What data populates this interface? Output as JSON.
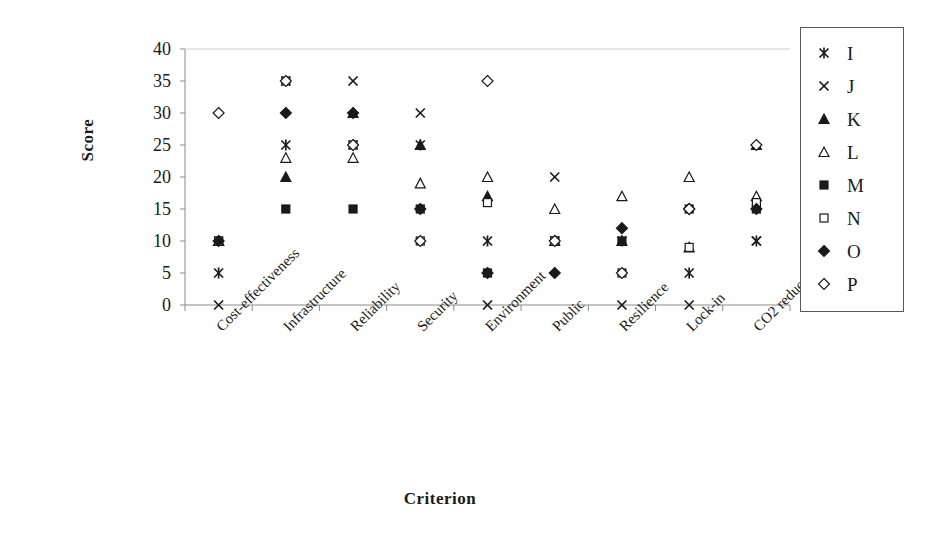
{
  "chart_data": {
    "type": "scatter",
    "title": "",
    "xlabel": "Criterion",
    "ylabel": "Score",
    "ylim": [
      0,
      40
    ],
    "yticks": [
      0,
      5,
      10,
      15,
      20,
      25,
      30,
      35,
      40
    ],
    "grid": false,
    "legend_position": "right",
    "categories": [
      "Cost-effectiveness",
      "Infrastructure",
      "Reliability",
      "Security",
      "Environment",
      "Public",
      "Resilience",
      "Lock-in",
      "CO2 reduction"
    ],
    "series": [
      {
        "name": "I",
        "marker": "asterisk",
        "filled": true,
        "values": [
          5,
          25,
          25,
          25,
          10,
          10,
          10,
          5,
          10
        ]
      },
      {
        "name": "J",
        "marker": "cross",
        "filled": true,
        "values": [
          0,
          35,
          35,
          30,
          0,
          20,
          0,
          0,
          10
        ]
      },
      {
        "name": "K",
        "marker": "triangle",
        "filled": true,
        "values": [
          10,
          20,
          30,
          25,
          17,
          10,
          10,
          9,
          25
        ]
      },
      {
        "name": "L",
        "marker": "triangle-open",
        "filled": false,
        "values": [
          10,
          23,
          23,
          19,
          20,
          15,
          17,
          20,
          17
        ]
      },
      {
        "name": "M",
        "marker": "square",
        "filled": true,
        "values": [
          10,
          15,
          15,
          15,
          5,
          10,
          10,
          15,
          15
        ]
      },
      {
        "name": "N",
        "marker": "square-open",
        "filled": false,
        "values": [
          10,
          35,
          25,
          10,
          16,
          10,
          5,
          9,
          16
        ]
      },
      {
        "name": "O",
        "marker": "diamond",
        "filled": true,
        "values": [
          10,
          30,
          30,
          15,
          5,
          5,
          12,
          15,
          15
        ]
      },
      {
        "name": "P",
        "marker": "diamond-open",
        "filled": false,
        "values": [
          30,
          35,
          25,
          10,
          35,
          10,
          5,
          15,
          25
        ]
      }
    ]
  },
  "legend": {
    "entries": [
      {
        "label": "I",
        "marker": "asterisk"
      },
      {
        "label": "J",
        "marker": "cross"
      },
      {
        "label": "K",
        "marker": "triangle"
      },
      {
        "label": "L",
        "marker": "triangle-open"
      },
      {
        "label": "M",
        "marker": "square"
      },
      {
        "label": "N",
        "marker": "square-open"
      },
      {
        "label": "O",
        "marker": "diamond"
      },
      {
        "label": "P",
        "marker": "diamond-open"
      }
    ]
  },
  "colors": {
    "marker": "#1a1a1a",
    "axis": "#8a8a8a",
    "text": "#1a1a1a",
    "background": "#ffffff"
  }
}
